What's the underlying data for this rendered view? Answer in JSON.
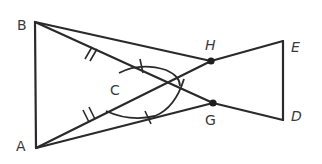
{
  "diagram": {
    "type": "geometry-figure",
    "points": {
      "A": {
        "label": "A",
        "x": 36,
        "y": 148
      },
      "B": {
        "label": "B",
        "x": 35,
        "y": 22
      },
      "C": {
        "label": "C",
        "x": 138,
        "y": 83
      },
      "D": {
        "label": "D",
        "x": 283,
        "y": 120
      },
      "E": {
        "label": "E",
        "x": 283,
        "y": 41
      },
      "G": {
        "label": "G",
        "x": 213,
        "y": 103
      },
      "H": {
        "label": "H",
        "x": 211,
        "y": 61
      }
    },
    "segments": [
      [
        "B",
        "A"
      ],
      [
        "B",
        "H"
      ],
      [
        "A",
        "G"
      ],
      [
        "B",
        "G"
      ],
      [
        "A",
        "H"
      ],
      [
        "H",
        "E"
      ],
      [
        "G",
        "D"
      ],
      [
        "E",
        "D"
      ]
    ],
    "markings": {
      "congruent_segments_double_tick": [
        "BC",
        "AC"
      ],
      "congruent_angles_single_tick": [
        "angle at C (upper arc)",
        "angle at C (lower arc)"
      ],
      "dots": [
        "H",
        "G"
      ]
    },
    "colors": {
      "stroke": "#2a2a2a",
      "label": "#3a3a3a",
      "background": "#ffffff"
    }
  }
}
